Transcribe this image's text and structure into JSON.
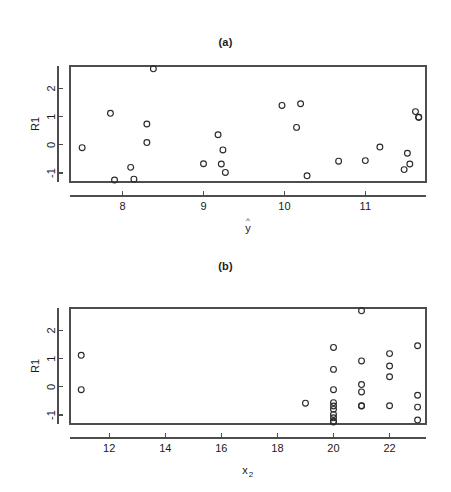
{
  "figure": {
    "background_color": "#ffffff",
    "foreground_color": "#1a1a1a",
    "axis_color": "#4d4d4d",
    "marker_color": "#2b2b2b",
    "marker_shape": "open-circle"
  },
  "panels": [
    {
      "id": "a",
      "title": "(a)",
      "xlabel": "ŷ",
      "xlabel_base": "y",
      "xlabel_accent": "^",
      "ylabel": "R1",
      "x_ticks": [
        8,
        9,
        10,
        11
      ],
      "x_tick_labels": [
        "8",
        "9",
        "10",
        "11"
      ],
      "y_ticks": [
        -1,
        0,
        1,
        2
      ],
      "y_tick_labels": [
        "-1",
        "0",
        "1",
        "2"
      ]
    },
    {
      "id": "b",
      "title": "(b)",
      "xlabel": "x₂",
      "xlabel_base": "x",
      "xlabel_sub": "2",
      "ylabel": "R1",
      "x_ticks": [
        12,
        14,
        16,
        18,
        20,
        22
      ],
      "x_tick_labels": [
        "12",
        "14",
        "16",
        "18",
        "20",
        "22"
      ],
      "y_ticks": [
        -1,
        0,
        1,
        2
      ],
      "y_tick_labels": [
        "-1",
        "0",
        "1",
        "2"
      ]
    }
  ],
  "chart_data": [
    {
      "type": "scatter",
      "panel": "a",
      "title": "(a)",
      "xlabel": "ŷ",
      "ylabel": "R1",
      "xlim": [
        7.35,
        11.75
      ],
      "ylim": [
        -1.32,
        2.8
      ],
      "grid": false,
      "legend": null,
      "x": [
        7.5,
        7.85,
        7.9,
        8.1,
        8.14,
        8.3,
        8.3,
        8.38,
        9.0,
        9.18,
        9.22,
        9.24,
        9.27,
        9.97,
        10.15,
        10.2,
        10.28,
        10.67,
        11.0,
        11.18,
        11.48,
        11.52,
        11.55,
        11.62,
        11.66,
        11.66
      ],
      "y": [
        -0.1,
        1.12,
        -1.25,
        -0.8,
        -1.22,
        0.74,
        0.08,
        2.7,
        -0.67,
        0.36,
        -0.68,
        -0.18,
        -0.98,
        1.4,
        0.62,
        1.46,
        -1.1,
        -0.58,
        -0.56,
        -0.08,
        -0.88,
        -0.3,
        -0.68,
        1.18,
        0.98,
        0.98
      ]
    },
    {
      "type": "scatter",
      "panel": "b",
      "title": "(b)",
      "xlabel": "x₂",
      "ylabel": "R1",
      "xlim": [
        10.6,
        23.3
      ],
      "ylim": [
        -1.32,
        2.8
      ],
      "grid": false,
      "legend": null,
      "x": [
        11.0,
        11.0,
        19.0,
        20.0,
        20.0,
        20.0,
        20.0,
        20.0,
        20.0,
        20.0,
        20.0,
        20.0,
        20.0,
        21.0,
        21.0,
        21.0,
        21.0,
        21.0,
        21.0,
        22.0,
        22.0,
        22.0,
        22.0,
        23.0,
        23.0,
        23.0,
        23.0
      ],
      "y": [
        1.12,
        -0.1,
        -0.58,
        1.4,
        0.62,
        -0.1,
        -0.56,
        -0.68,
        -0.8,
        -0.98,
        -1.1,
        -1.22,
        -1.25,
        0.92,
        0.08,
        -0.18,
        -0.67,
        -0.68,
        2.7,
        1.18,
        0.74,
        0.36,
        -0.67,
        1.46,
        -0.3,
        -0.72,
        -1.18
      ]
    }
  ]
}
